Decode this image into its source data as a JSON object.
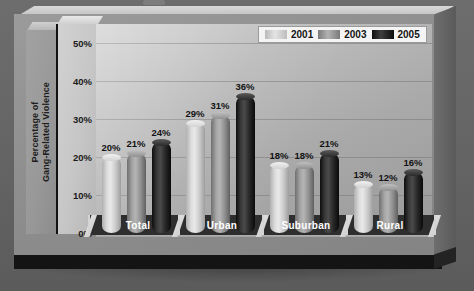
{
  "chart_data": {
    "type": "bar",
    "title": "",
    "xlabel": "",
    "ylabel": "Percentage of\nGang-Related Violence",
    "categories": [
      "Total",
      "Urban",
      "Suburban",
      "Rural"
    ],
    "series": [
      {
        "name": "2001",
        "values": [
          20,
          29,
          18,
          13
        ],
        "color": "#dedede"
      },
      {
        "name": "2003",
        "values": [
          21,
          31,
          18,
          12
        ],
        "color": "#a6a6a6"
      },
      {
        "name": "2005",
        "values": [
          24,
          36,
          21,
          16
        ],
        "color": "#1a1a1a"
      }
    ],
    "value_labels": [
      [
        "20%",
        "29%",
        "18%",
        "13%"
      ],
      [
        "21%",
        "31%",
        "18%",
        "12%"
      ],
      [
        "24%",
        "36%",
        "21%",
        "16%"
      ]
    ],
    "ylim": [
      0,
      55
    ],
    "yticks": [
      0,
      10,
      20,
      30,
      40,
      50
    ],
    "ytick_labels": [
      "0%",
      "10%",
      "20%",
      "30%",
      "40%",
      "50%"
    ],
    "grid": true,
    "legend_position": "top-right",
    "style": "3d-cylinder-grayscale"
  },
  "legend": {
    "items": [
      {
        "label": "2001",
        "swatch": "series-2001-swatch"
      },
      {
        "label": "2003",
        "swatch": "series-2003-swatch"
      },
      {
        "label": "2005",
        "swatch": "series-2005-swatch"
      }
    ]
  },
  "colors": {
    "background": "#676767",
    "plot_wall": "#bdbdbd",
    "category_strip": "#2e2e2e",
    "base_plate": "#141414",
    "text": "#141414",
    "category_text": "#ffffff"
  }
}
